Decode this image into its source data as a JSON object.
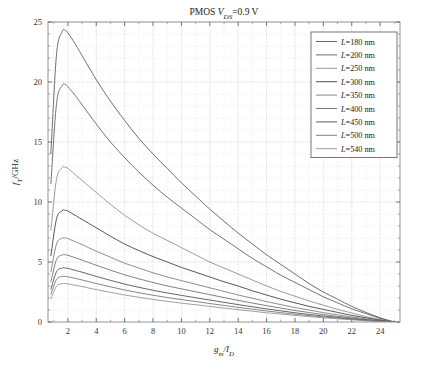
{
  "figure": {
    "title_main": "PMOS ",
    "title_var": "V",
    "title_sub": "DS",
    "title_tail": "=0.9 V"
  },
  "axes": {
    "xlabel_main": "g",
    "xlabel_sub1": "m",
    "xlabel_mid": "/I",
    "xlabel_sub2": "D",
    "ylabel_main": "f",
    "ylabel_sub": "T",
    "ylabel_tail": "/GHz",
    "xticks": [
      "2",
      "4",
      "6",
      "8",
      "10",
      "12",
      "14",
      "16",
      "18",
      "20",
      "22",
      "24"
    ],
    "yticks": [
      "0",
      "5",
      "10",
      "15",
      "20",
      "25"
    ]
  },
  "legend": {
    "items": [
      {
        "label_var": "L",
        "label": "=180 nm",
        "color": "#555555"
      },
      {
        "label_var": "L",
        "label": "=200 nm",
        "color": "#5c5c5c"
      },
      {
        "label_var": "L",
        "label": "=250 nm",
        "color": "#8a8a8a"
      },
      {
        "label_var": "L",
        "label": "=300 nm",
        "color": "#3a3a3a"
      },
      {
        "label_var": "L",
        "label": "=350 nm",
        "color": "#7a7a7a"
      },
      {
        "label_var": "L",
        "label": "=400 nm",
        "color": "#6a6a6a"
      },
      {
        "label_var": "L",
        "label": "=450 nm",
        "color": "#4a4a4a"
      },
      {
        "label_var": "L",
        "label": "=500 nm",
        "color": "#707070"
      },
      {
        "label_var": "L",
        "label": "=540 nm",
        "color": "#8f8f8f"
      }
    ]
  },
  "chart_data": {
    "type": "line",
    "xlabel": "g_m/I_D",
    "ylabel": "f_T/GHz",
    "xlim": [
      0.6,
      25
    ],
    "ylim": [
      0,
      25
    ],
    "grid": true,
    "legend_position": "top-right",
    "x": [
      0.8,
      1.2,
      1.6,
      1.8,
      2.0,
      2.5,
      3.0,
      4.0,
      5.0,
      6.0,
      7.0,
      8.0,
      9.0,
      10.0,
      11.0,
      12.0,
      13.0,
      14.0,
      15.0,
      16.0,
      17.0,
      18.0,
      19.0,
      20.0,
      21.0,
      22.0,
      23.0,
      24.0,
      25.0
    ],
    "series": [
      {
        "name": "L=180 nm",
        "values": [
          14.0,
          22.3,
          24.2,
          24.3,
          24.1,
          23.2,
          22.2,
          20.2,
          18.4,
          16.8,
          15.3,
          14.0,
          12.8,
          11.6,
          10.5,
          9.4,
          8.4,
          7.4,
          6.5,
          5.6,
          4.8,
          4.0,
          3.2,
          2.5,
          1.9,
          1.3,
          0.8,
          0.35,
          0.0
        ]
      },
      {
        "name": "L=200 nm",
        "values": [
          11.5,
          18.2,
          19.7,
          19.8,
          19.6,
          18.9,
          18.1,
          16.5,
          15.0,
          13.7,
          12.5,
          11.4,
          10.4,
          9.5,
          8.6,
          7.7,
          6.9,
          6.1,
          5.3,
          4.6,
          3.9,
          3.3,
          2.7,
          2.1,
          1.6,
          1.1,
          0.7,
          0.3,
          0.0
        ]
      },
      {
        "name": "L=250 nm",
        "values": [
          7.6,
          11.9,
          12.85,
          12.9,
          12.8,
          12.3,
          11.8,
          10.8,
          9.8,
          8.9,
          8.1,
          7.4,
          6.8,
          6.2,
          5.6,
          5.0,
          4.5,
          4.0,
          3.5,
          3.0,
          2.55,
          2.15,
          1.75,
          1.4,
          1.05,
          0.75,
          0.45,
          0.2,
          0.0
        ]
      },
      {
        "name": "L=300 nm",
        "values": [
          5.5,
          8.6,
          9.28,
          9.3,
          9.25,
          8.9,
          8.55,
          7.85,
          7.15,
          6.5,
          5.95,
          5.45,
          5.0,
          4.55,
          4.15,
          3.75,
          3.35,
          3.0,
          2.6,
          2.25,
          1.9,
          1.6,
          1.3,
          1.05,
          0.8,
          0.55,
          0.35,
          0.15,
          0.0
        ]
      },
      {
        "name": "L=350 nm",
        "values": [
          4.15,
          6.5,
          6.98,
          7.0,
          6.95,
          6.7,
          6.45,
          5.9,
          5.4,
          4.9,
          4.5,
          4.1,
          3.75,
          3.45,
          3.15,
          2.85,
          2.55,
          2.25,
          1.98,
          1.7,
          1.45,
          1.2,
          1.0,
          0.78,
          0.6,
          0.42,
          0.26,
          0.11,
          0.0
        ]
      },
      {
        "name": "L=400 nm",
        "values": [
          3.35,
          5.2,
          5.58,
          5.6,
          5.56,
          5.36,
          5.16,
          4.73,
          4.32,
          3.93,
          3.6,
          3.29,
          3.01,
          2.76,
          2.52,
          2.28,
          2.04,
          1.8,
          1.58,
          1.36,
          1.16,
          0.96,
          0.79,
          0.62,
          0.47,
          0.33,
          0.2,
          0.09,
          0.0
        ]
      },
      {
        "name": "L=450 nm",
        "values": [
          2.7,
          4.2,
          4.49,
          4.5,
          4.47,
          4.31,
          4.15,
          3.8,
          3.47,
          3.16,
          2.89,
          2.64,
          2.42,
          2.22,
          2.02,
          1.83,
          1.64,
          1.45,
          1.27,
          1.09,
          0.93,
          0.77,
          0.63,
          0.5,
          0.38,
          0.26,
          0.16,
          0.07,
          0.0
        ]
      },
      {
        "name": "L=500 nm",
        "values": [
          2.28,
          3.55,
          3.79,
          3.8,
          3.77,
          3.64,
          3.5,
          3.21,
          2.93,
          2.67,
          2.44,
          2.23,
          2.04,
          1.87,
          1.71,
          1.54,
          1.38,
          1.22,
          1.07,
          0.92,
          0.78,
          0.65,
          0.53,
          0.42,
          0.32,
          0.22,
          0.13,
          0.06,
          0.0
        ]
      },
      {
        "name": "L=540 nm",
        "values": [
          1.92,
          2.99,
          3.19,
          3.2,
          3.18,
          3.06,
          2.95,
          2.7,
          2.47,
          2.25,
          2.06,
          1.88,
          1.72,
          1.57,
          1.44,
          1.3,
          1.16,
          1.03,
          0.9,
          0.77,
          0.66,
          0.55,
          0.45,
          0.35,
          0.27,
          0.19,
          0.11,
          0.05,
          0.0
        ]
      }
    ]
  }
}
